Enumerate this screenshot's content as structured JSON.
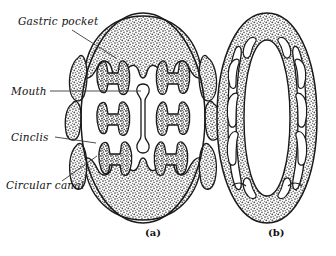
{
  "figure": {
    "labels": [
      {
        "id": "gastric-pocket",
        "text": "Gastric pocket",
        "x": 18,
        "y": 22
      },
      {
        "id": "mouth",
        "text": "Mouth",
        "x": 11,
        "y": 94
      },
      {
        "id": "cinclis",
        "text": "Cinclis",
        "x": 11,
        "y": 140
      },
      {
        "id": "circular-canal",
        "text": "Circular canal",
        "x": 6,
        "y": 188
      }
    ],
    "captions": [
      {
        "id": "caption-a",
        "text": "(a)",
        "x": 145,
        "y": 233
      },
      {
        "id": "caption-b",
        "text": "(b)",
        "x": 268,
        "y": 233
      }
    ],
    "colors": {
      "ink": "#1a1a1a",
      "stipple": "#8a8a8a",
      "stipple_dark": "#6f6f6f",
      "background": "#ffffff",
      "leader": "#3a3a3a"
    },
    "leaders": [
      {
        "id": "leader-gastric-pocket",
        "from": [
          72,
          30
        ],
        "to": [
          116,
          58
        ]
      },
      {
        "id": "leader-mouth",
        "from": [
          50,
          91
        ],
        "to": [
          141,
          91
        ]
      },
      {
        "id": "leader-cinclis",
        "from": [
          55,
          137
        ],
        "to": [
          96,
          143
        ]
      },
      {
        "id": "leader-circular-canal",
        "from": [
          62,
          181
        ],
        "to": [
          97,
          156
        ]
      }
    ],
    "specimen_a": {
      "name": "anemone-cross-section-expanded",
      "center": [
        143,
        118
      ],
      "radius_x": 62,
      "radius_y": 105,
      "mouth_slit": {
        "cx": 143,
        "top": 85,
        "bottom": 152,
        "width": 9
      },
      "mesentery_pairs": 4,
      "cinclis_count": 8
    },
    "specimen_b": {
      "name": "anemone-cross-section-contracted",
      "center": [
        267,
        118
      ],
      "radius_x": 50,
      "radius_y": 105,
      "central_cavity": {
        "cx": 267,
        "rx": 23,
        "ry": 80
      },
      "pocket_count": 10
    }
  }
}
